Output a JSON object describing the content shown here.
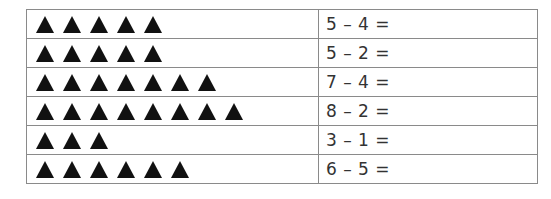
{
  "worksheet": {
    "rows": [
      {
        "triangle_count": 5,
        "equation": "5 – 4 ="
      },
      {
        "triangle_count": 5,
        "equation": "5 – 2 ="
      },
      {
        "triangle_count": 7,
        "equation": "7 – 4 ="
      },
      {
        "triangle_count": 8,
        "equation": "8 – 2 ="
      },
      {
        "triangle_count": 3,
        "equation": "3 – 1 ="
      },
      {
        "triangle_count": 6,
        "equation": "6 – 5 ="
      }
    ],
    "icon": "filled-triangle-icon",
    "triangle_color": "#111111",
    "border_color": "#8a8a8a"
  }
}
